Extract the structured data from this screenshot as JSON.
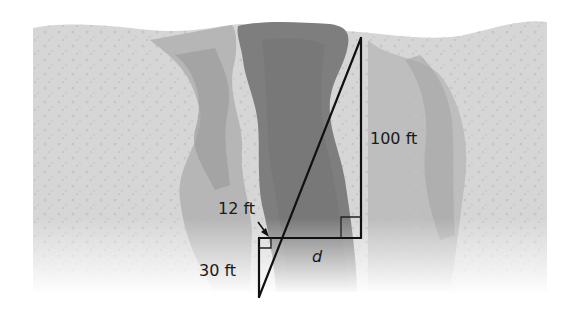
{
  "diagram": {
    "colors": {
      "background": "#ffffff",
      "rock_light": "#d4d4d4",
      "rock_mid": "#b5b5b5",
      "rock_dark": "#999999",
      "canyon": "#7d7d7d",
      "line": "#111111"
    },
    "labels": {
      "height_large": "100 ft",
      "small_base": "12 ft",
      "small_height": "30 ft",
      "unknown_width": "d"
    },
    "points": {
      "top_vertex": [
        361,
        38
      ],
      "large_right_angle": [
        361,
        238
      ],
      "intersection": [
        281,
        238
      ],
      "small_right_angle": [
        259,
        238
      ],
      "bottom_vertex": [
        259,
        297
      ]
    },
    "annotations": {
      "right_angle_markers": 2,
      "arrow": "points from 12 ft label to small horizontal leg"
    }
  }
}
